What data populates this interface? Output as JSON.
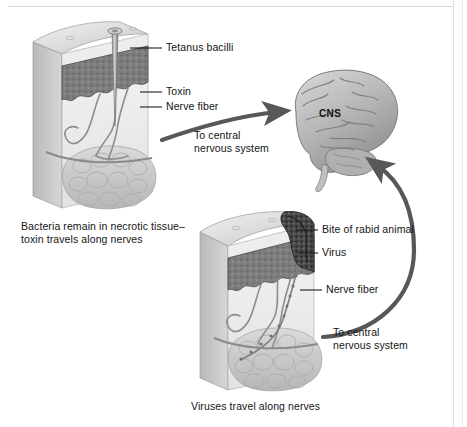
{
  "figure": {
    "background_color": "#ffffff",
    "ink_color": "#141414",
    "arrow_color": "#58585a"
  },
  "upper_panel": {
    "name": "tetanus-skin-block",
    "description": "Cross-section block of skin punctured by a nail",
    "labels": [
      {
        "id": "tetanus-bacilli",
        "text": "Tetanus bacilli"
      },
      {
        "id": "toxin",
        "text": "Toxin"
      },
      {
        "id": "nerve-fiber",
        "text": "Nerve fiber"
      }
    ],
    "arrow_label": "To central\nnervous system",
    "arrow_label_line1": "To central",
    "arrow_label_line2": "nervous system",
    "caption_line1": "Bacteria remain in necrotic tissue–",
    "caption_line2": "toxin travels along nerves"
  },
  "brain": {
    "name": "central-nervous-system",
    "label": "CNS"
  },
  "lower_panel": {
    "name": "rabies-skin-block",
    "description": "Cross-section block of skin with a bite wound",
    "labels": [
      {
        "id": "bite-of-rabid-animal",
        "text": "Bite of rabid animal"
      },
      {
        "id": "virus",
        "text": "Virus"
      },
      {
        "id": "nerve-fiber",
        "text": "Nerve fiber"
      }
    ],
    "arrow_label_line1": "To central",
    "arrow_label_line2": "nervous system",
    "caption": "Viruses travel along nerves"
  }
}
